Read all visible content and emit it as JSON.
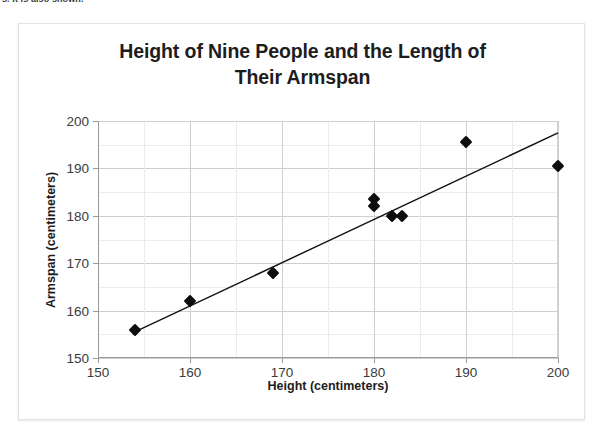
{
  "clipped_top_text": "s. It is also shown.",
  "chart_data": {
    "type": "scatter",
    "title": "Height of Nine People and the Length of Their Armspan",
    "title_line1": "Height of Nine People and the Length of",
    "title_line2": "Their Armspan",
    "xlabel": "Height (centimeters)",
    "ylabel": "Armspan (centimeters)",
    "xlim": [
      150,
      200
    ],
    "ylim": [
      150,
      200
    ],
    "xticks": [
      150,
      160,
      170,
      180,
      190,
      200
    ],
    "yticks": [
      150,
      160,
      170,
      180,
      190,
      200
    ],
    "xtick_labels": [
      "150",
      "160",
      "170",
      "180",
      "190",
      "200"
    ],
    "ytick_labels": [
      "150",
      "160",
      "170",
      "180",
      "190",
      "200"
    ],
    "minor_gridline_step": 5,
    "grid": true,
    "legend": false,
    "marker_shape": "diamond",
    "marker_color": "#0d0d0d",
    "points": [
      {
        "x": 154,
        "y": 156
      },
      {
        "x": 160,
        "y": 162
      },
      {
        "x": 169,
        "y": 168
      },
      {
        "x": 180,
        "y": 182
      },
      {
        "x": 180,
        "y": 183.5
      },
      {
        "x": 182,
        "y": 180
      },
      {
        "x": 183,
        "y": 180
      },
      {
        "x": 190,
        "y": 195.5
      },
      {
        "x": 200,
        "y": 190.5
      }
    ],
    "trendline": {
      "visible": true,
      "color": "#111111",
      "x_start": 154,
      "y_start": 155.5,
      "x_end": 200,
      "y_end": 197.5
    }
  }
}
